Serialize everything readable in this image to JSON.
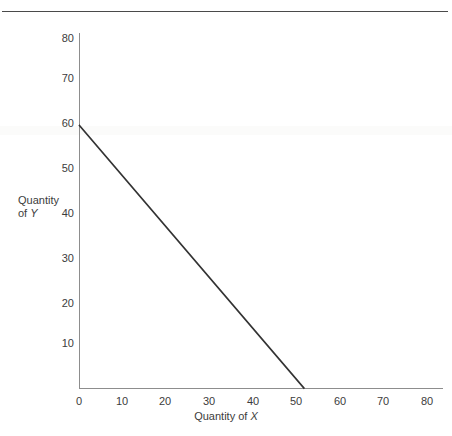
{
  "figure": {
    "has_top_rule": true,
    "background_color": "#ffffff",
    "line_color": "#333333",
    "axis_color": "#8d8d8d",
    "text_color": "#3c3c3c"
  },
  "axis_titles": {
    "y_line1": "Quantity",
    "y_line2_prefix": "of ",
    "y_line2_var": "Y",
    "x_prefix": "Quantity of ",
    "x_var": "X"
  },
  "ticks": {
    "y": [
      "80",
      "70",
      "60",
      "50",
      "40",
      "30",
      "20",
      "10"
    ],
    "x": [
      "0",
      "10",
      "20",
      "30",
      "40",
      "50",
      "60",
      "70",
      "80"
    ]
  },
  "chart_data": {
    "type": "line",
    "title": "",
    "subtitle": "",
    "xlabel": "Quantity of X",
    "ylabel": "Quantity of Y",
    "xlim": [
      0,
      81
    ],
    "ylim": [
      0,
      80
    ],
    "xticks": [
      0,
      10,
      20,
      30,
      40,
      50,
      60,
      70,
      80
    ],
    "yticks": [
      10,
      20,
      30,
      40,
      50,
      60,
      70,
      80
    ],
    "grid": false,
    "legend": false,
    "legend_position": "none",
    "annotations": [],
    "series": [
      {
        "name": "Budget constraint",
        "x": [
          0,
          50
        ],
        "y": [
          60,
          0
        ],
        "x_intercept": 50,
        "y_intercept": 60,
        "slope": -1.2,
        "color": "#333333",
        "linewidth": 1.6,
        "style": "solid"
      }
    ]
  }
}
